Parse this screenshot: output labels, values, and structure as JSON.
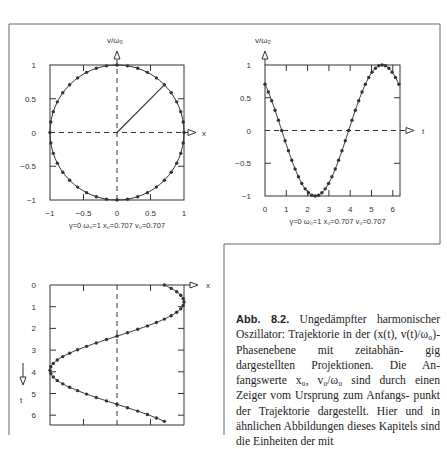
{
  "figure": {
    "label": "Abb. 8.2.",
    "caption_lines": [
      "Ungedämpfter harmonischer",
      "Oszillator: Trajektorie in der (x(t),",
      "v(t)/ω₀)-Phasenebene mit zeitabhän-",
      "gig dargestellten Projektionen. Die An-",
      "fangswerte x₀, v₀/ω₀ sind durch einen",
      "Zeiger vom Ursprung zum Anfangs-",
      "punkt der Trajektorie dargestellt. Hier",
      "und in ähnlichen Abbildungen dieses",
      "Kapitels sind die Einheiten der mit"
    ],
    "params_label": "γ=0  ω₀=1  x₀=0.707  v₀=0.707"
  },
  "chart_data": [
    {
      "type": "line",
      "name": "phase-plane",
      "title": "",
      "xlabel": "x",
      "ylabel": "v/ω₀",
      "xlim": [
        -1,
        1
      ],
      "ylim": [
        -1,
        1
      ],
      "xticks": [
        "-1",
        "-0.5",
        "0",
        "0.5",
        "1"
      ],
      "yticks": [
        "1",
        "0.5",
        "0",
        "-0.5",
        "-1"
      ],
      "curve": "unit circle x=cos(t-π/4), v=-sin(t-π/4)",
      "pointer": {
        "from": [
          0,
          0
        ],
        "to": [
          0.707,
          0.707
        ]
      },
      "annotation": "γ=0  ω₀=1  x₀=0.707  v₀=0.707"
    },
    {
      "type": "line",
      "name": "velocity-vs-time",
      "xlabel": "t",
      "ylabel": "v/ω₀",
      "xlim": [
        0,
        6.28
      ],
      "ylim": [
        -1,
        1
      ],
      "xticks": [
        "0",
        "1",
        "2",
        "3",
        "4",
        "5",
        "6"
      ],
      "yticks": [
        "1",
        "0.5",
        "0",
        "-0.5",
        "-1"
      ],
      "series": [
        {
          "name": "v(t)/ω₀",
          "x": [
            0,
            0.785,
            2.356,
            3.927,
            5.498,
            6.28
          ],
          "values": [
            0.707,
            0,
            -1,
            0,
            1,
            0.707
          ]
        }
      ],
      "annotation": "γ=0  ω₀=1  x₀=0.707  v₀=0.707"
    },
    {
      "type": "line",
      "name": "position-vs-time",
      "xlabel": "x",
      "ylabel": "t",
      "orientation": "time axis vertical, pointing down",
      "ylim": [
        0,
        6.28
      ],
      "xlim": [
        -1,
        1
      ],
      "yticks": [
        "0",
        "1",
        "2",
        "3",
        "4",
        "5",
        "6"
      ],
      "series": [
        {
          "name": "x(t)",
          "t": [
            0,
            0.785,
            2.356,
            3.927,
            5.498,
            6.28
          ],
          "values": [
            0.707,
            1,
            0,
            -1,
            0,
            0.707
          ]
        }
      ]
    }
  ],
  "axis_labels": {
    "x": "x",
    "t": "t",
    "v": "v/ω₀"
  }
}
